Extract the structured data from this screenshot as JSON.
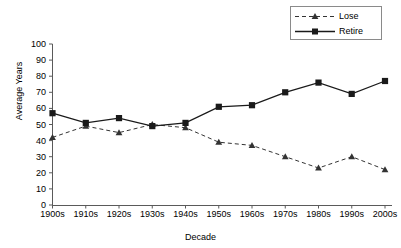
{
  "chart_data": {
    "type": "line",
    "title": "",
    "xlabel": "Decade",
    "ylabel": "Average Years",
    "categories": [
      "1900s",
      "1910s",
      "1920s",
      "1930s",
      "1940s",
      "1950s",
      "1960s",
      "1970s",
      "1980s",
      "1990s",
      "2000s"
    ],
    "series": [
      {
        "name": "Lose",
        "marker": "triangle",
        "linestyle": "dashed",
        "color": "#333333",
        "values": [
          42,
          49,
          45,
          50,
          48,
          39,
          37,
          30,
          23,
          30,
          22
        ]
      },
      {
        "name": "Retire",
        "marker": "square",
        "linestyle": "solid",
        "color": "#1a1a1a",
        "values": [
          57,
          51,
          54,
          49,
          51,
          61,
          62,
          70,
          76,
          69,
          77
        ]
      }
    ],
    "ylim": [
      0,
      100
    ],
    "ytick_labels": [
      "100",
      "90",
      "80",
      "70",
      "60",
      "50",
      "40",
      "30",
      "20",
      "10",
      "0"
    ],
    "ytick_values": [
      100,
      90,
      80,
      70,
      60,
      50,
      40,
      30,
      20,
      10,
      0
    ],
    "grid": false,
    "legend_position": "top-right"
  },
  "legend": {
    "entries": [
      {
        "label": "Lose"
      },
      {
        "label": "Retire"
      }
    ]
  },
  "axes": {
    "y_title": "Average Years",
    "x_title": "Decade"
  }
}
